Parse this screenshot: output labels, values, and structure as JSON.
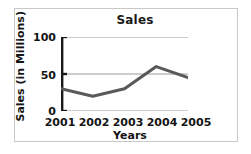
{
  "chart_data": {
    "type": "line",
    "title": "Sales",
    "xlabel": "Years",
    "ylabel": "Sales (in Millions)",
    "categories": [
      "2001",
      "2002",
      "2003",
      "2004",
      "2005"
    ],
    "values": [
      30,
      20,
      30,
      60,
      45
    ],
    "series": [
      {
        "name": "Sales",
        "values": [
          30,
          20,
          30,
          60,
          45
        ]
      }
    ],
    "ylim": [
      0,
      100
    ],
    "yticks": [
      0,
      50,
      100
    ],
    "ytick_labels": [
      "0",
      "50",
      "100"
    ],
    "grid": true,
    "grid_axis": "y",
    "legend": false,
    "legend_position": "none",
    "line_color": "#595959",
    "gridline_color": "#9a9a9a",
    "axis_color": "#1a1a1a",
    "markers": false
  },
  "figure": {
    "border_color": "#c8c8c8",
    "background": "#ffffff"
  }
}
